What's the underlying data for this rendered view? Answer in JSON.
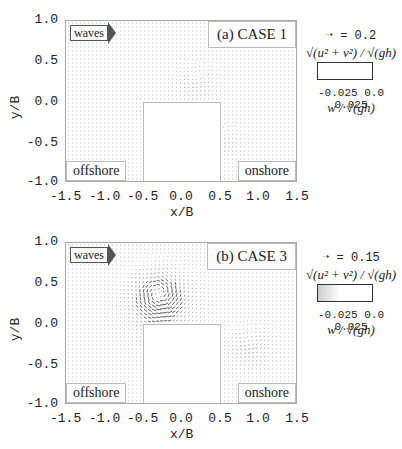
{
  "panels": [
    {
      "id": "a",
      "title": "(a) CASE 1",
      "waves_label": "waves",
      "offshore_label": "offshore",
      "onshore_label": "onshore",
      "reference_vector": "= 0.2",
      "vector_magnitude_label": "√(u² + v²) / √(gh)",
      "colorbar_ticks": [
        "-0.025",
        "0.0",
        "0.025"
      ],
      "colorbar_label": "w / √(gh)",
      "xlabel": "x/B",
      "ylabel": "y/B"
    },
    {
      "id": "b",
      "title": "(b) CASE 3",
      "waves_label": "waves",
      "offshore_label": "offshore",
      "onshore_label": "onshore",
      "reference_vector": "= 0.15",
      "vector_magnitude_label": "√(u² + v²) / √(gh)",
      "colorbar_ticks": [
        "-0.025",
        "0.0",
        "0.025"
      ],
      "colorbar_label": "w / √(gh)",
      "xlabel": "x/B",
      "ylabel": "y/B"
    }
  ],
  "axes": {
    "xticks": [
      "-1.5",
      "-1.0",
      "-0.5",
      "0.0",
      "0.5",
      "1.0",
      "1.5"
    ],
    "yticks": [
      "1.0",
      "0.5",
      "0.0",
      "-0.5",
      "-1.0"
    ]
  },
  "chart_data": [
    {
      "type": "quiver",
      "title": "(a) CASE 1",
      "xlabel": "x/B",
      "ylabel": "y/B",
      "xlim": [
        -1.5,
        1.5
      ],
      "ylim": [
        -1.0,
        1.0
      ],
      "xticks": [
        -1.5,
        -1.0,
        -0.5,
        0.0,
        0.5,
        1.0,
        1.5
      ],
      "yticks": [
        1.0,
        0.5,
        0.0,
        -0.5,
        -1.0
      ],
      "obstacle": {
        "x": [
          -0.5,
          0.5
        ],
        "y": [
          -1.0,
          0.0
        ]
      },
      "reference_vector": 0.2,
      "colorbar": {
        "label": "w/sqrt(gh)",
        "range": [
          -0.025,
          0.025
        ],
        "ticks": [
          -0.025,
          0.0,
          0.025
        ]
      },
      "annotations": [
        "waves",
        "offshore",
        "onshore"
      ],
      "features": "strong flow along top edge of obstacle and vertical jets at corners x=-0.5 and x=0.5; eddy near (0.2, 0.3)"
    },
    {
      "type": "quiver",
      "title": "(b) CASE 3",
      "xlabel": "x/B",
      "ylabel": "y/B",
      "xlim": [
        -1.5,
        1.5
      ],
      "ylim": [
        -1.0,
        1.0
      ],
      "xticks": [
        -1.5,
        -1.0,
        -0.5,
        0.0,
        0.5,
        1.0,
        1.5
      ],
      "yticks": [
        1.0,
        0.5,
        0.0,
        -0.5,
        -1.0
      ],
      "obstacle": {
        "x": [
          -0.5,
          0.5
        ],
        "y": [
          -1.0,
          0.0
        ]
      },
      "reference_vector": 0.15,
      "colorbar": {
        "label": "w/sqrt(gh)",
        "range": [
          -0.025,
          0.025
        ],
        "ticks": [
          -0.025,
          0.0,
          0.025
        ]
      },
      "annotations": [
        "waves",
        "offshore",
        "onshore"
      ],
      "features": "large vortex centered near (-0.3, 0.35); secondary vortex near (0.85, -0.2) onshore side"
    }
  ]
}
